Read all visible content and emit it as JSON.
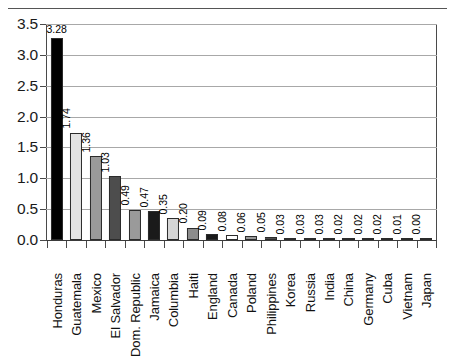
{
  "chart_data": {
    "type": "bar",
    "title": "",
    "subtitle": "",
    "xlabel": "",
    "ylabel": "",
    "ylim": [
      0.0,
      3.5
    ],
    "ytick_labels": [
      "0.0",
      "0.5",
      "1.0",
      "1.5",
      "2.0",
      "2.5",
      "3.0",
      "3.5"
    ],
    "ytick_values": [
      0.0,
      0.5,
      1.0,
      1.5,
      2.0,
      2.5,
      3.0,
      3.5
    ],
    "grid": true,
    "grid_axis": "y",
    "legend": false,
    "legend_position": "none",
    "categories": [
      "Honduras",
      "Guatemala",
      "Mexico",
      "El Salvador",
      "Dom. Republic",
      "Jamaica",
      "Columbia",
      "Haiti",
      "England",
      "Canada",
      "Poland",
      "Philippines",
      "Korea",
      "Russia",
      "India",
      "China",
      "Germany",
      "Cuba",
      "Vietnam",
      "Japan"
    ],
    "values": [
      3.28,
      1.74,
      1.36,
      1.03,
      0.49,
      0.47,
      0.35,
      0.2,
      0.09,
      0.08,
      0.06,
      0.05,
      0.03,
      0.03,
      0.03,
      0.02,
      0.02,
      0.02,
      0.01,
      0.0
    ],
    "value_labels": [
      "3.28",
      "1.74",
      "1.36",
      "1.03",
      "0.49",
      "0.47",
      "0.35",
      "0.20",
      "0.09",
      "0.08",
      "0.06",
      "0.05",
      "0.03",
      "0.03",
      "0.03",
      "0.02",
      "0.02",
      "0.02",
      "0.01",
      "0.00"
    ],
    "bar_colors": [
      "#000000",
      "#e3e3e3",
      "#9a9a9a",
      "#4d4d4d",
      "#9a9a9a",
      "#1a1a1a",
      "#d6d6d6",
      "#8c8c8c",
      "#1a1a1a",
      "#ffffff",
      "#9a9a9a",
      "#4d4d4d",
      "#9a9a9a",
      "#1a1a1a",
      "#d6d6d6",
      "#8c8c8c",
      "#1a1a1a",
      "#ffffff",
      "#9a9a9a",
      "#4d4d4d"
    ],
    "bar_edge_color": "#2b2b2b",
    "grid_color": "#a8a8a8",
    "axis_color": "#3a3a3a",
    "background_color": "#ffffff"
  }
}
